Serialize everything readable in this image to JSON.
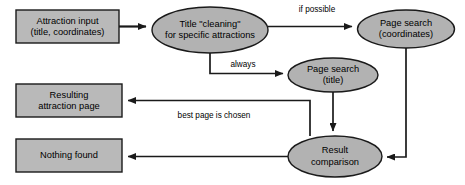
{
  "diagram": {
    "type": "flowchart",
    "canvas": {
      "width": 465,
      "height": 185
    },
    "colors": {
      "rect_fill": "#b9b9b9",
      "ellipse_fill": "#b2b2b2",
      "stroke": "#1a1a1a",
      "background": "#ffffff",
      "text": "#000000"
    },
    "nodes": {
      "attraction_input": {
        "shape": "rectangle",
        "line1": "Attraction input",
        "line2": "(title, coordinates)"
      },
      "title_cleaning": {
        "shape": "ellipse",
        "line1": "Title \"cleaning\"",
        "line2": "for specific attractions"
      },
      "page_search_coordinates": {
        "shape": "ellipse",
        "line1": "Page search",
        "line2": "(coordinates)"
      },
      "page_search_title": {
        "shape": "ellipse",
        "line1": "Page search",
        "line2": "(title)"
      },
      "resulting_attraction_page": {
        "shape": "rectangle",
        "line1": "Resulting",
        "line2": "attraction page"
      },
      "nothing_found": {
        "shape": "rectangle",
        "line1": "Nothing found",
        "line2": ""
      },
      "result_comparison": {
        "shape": "ellipse",
        "line1": "Result",
        "line2": "comparison"
      }
    },
    "edge_labels": {
      "if_possible": "if possible",
      "always": "always",
      "best_page_is_chosen": "best page is chosen"
    },
    "edges": [
      {
        "from": "attraction_input",
        "to": "title_cleaning",
        "label": ""
      },
      {
        "from": "title_cleaning",
        "to": "page_search_coordinates",
        "label": "if possible"
      },
      {
        "from": "title_cleaning",
        "to": "page_search_title",
        "label": "always"
      },
      {
        "from": "page_search_coordinates",
        "to": "result_comparison",
        "label": ""
      },
      {
        "from": "page_search_title",
        "to": "result_comparison",
        "label": ""
      },
      {
        "from": "result_comparison",
        "to": "resulting_attraction_page",
        "label": "best page is chosen"
      },
      {
        "from": "result_comparison",
        "to": "nothing_found",
        "label": ""
      }
    ]
  }
}
